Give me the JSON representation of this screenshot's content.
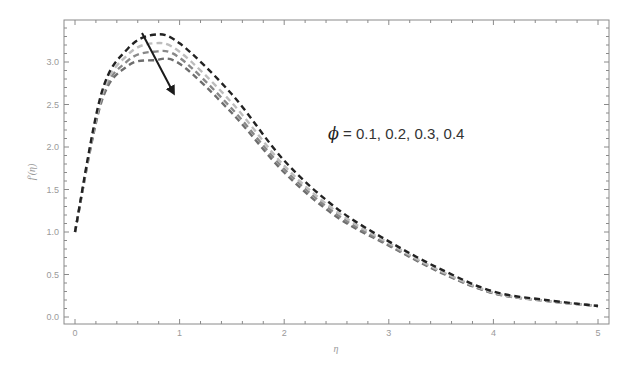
{
  "chart_data": {
    "type": "line",
    "title": "",
    "xlabel": "η",
    "ylabel": "f′(η)",
    "xlim": [
      -0.1,
      5.1
    ],
    "ylim": [
      -0.1,
      3.5
    ],
    "grid": false,
    "x_ticks": [
      "0",
      "1",
      "2",
      "3",
      "4",
      "5"
    ],
    "y_ticks": [
      "0.0",
      "0.5",
      "1.0",
      "1.5",
      "2.0",
      "2.5",
      "3.0"
    ],
    "annotation": {
      "symbol": "ϕ",
      "text": " = 0.1, 0.2, 0.3, 0.4",
      "arrow": "points downward-right: increasing ϕ decreases f′(η) peak"
    },
    "x": [
      0,
      0.25,
      0.5,
      0.75,
      1.0,
      1.5,
      2.0,
      2.5,
      3.0,
      3.5,
      4.0,
      4.5,
      5.0
    ],
    "series": [
      {
        "name": "ϕ = 0.1",
        "color": "#222222",
        "values": [
          1.0,
          2.62,
          3.15,
          3.32,
          3.22,
          2.62,
          1.84,
          1.28,
          0.89,
          0.56,
          0.3,
          0.2,
          0.13
        ]
      },
      {
        "name": "ϕ = 0.2",
        "color": "#bdbdbd",
        "values": [
          1.0,
          2.58,
          3.08,
          3.22,
          3.12,
          2.52,
          1.78,
          1.24,
          0.87,
          0.54,
          0.29,
          0.19,
          0.13
        ]
      },
      {
        "name": "ϕ = 0.3",
        "color": "#888888",
        "values": [
          1.0,
          2.55,
          3.01,
          3.12,
          3.05,
          2.45,
          1.74,
          1.21,
          0.85,
          0.53,
          0.28,
          0.19,
          0.13
        ]
      },
      {
        "name": "ϕ = 0.4",
        "color": "#6e6e6e",
        "values": [
          1.0,
          2.52,
          2.95,
          3.02,
          2.98,
          2.4,
          1.7,
          1.18,
          0.84,
          0.52,
          0.28,
          0.19,
          0.13
        ]
      }
    ]
  }
}
